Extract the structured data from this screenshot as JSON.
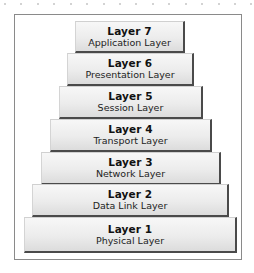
{
  "diagram": {
    "type": "osi-model-stack",
    "layers": [
      {
        "number_label": "Layer 7",
        "name": "Application Layer"
      },
      {
        "number_label": "Layer 6",
        "name": "Presentation Layer"
      },
      {
        "number_label": "Layer 5",
        "name": "Session Layer"
      },
      {
        "number_label": "Layer 4",
        "name": "Transport Layer"
      },
      {
        "number_label": "Layer 3",
        "name": "Network Layer"
      },
      {
        "number_label": "Layer 2",
        "name": "Data Link Layer"
      },
      {
        "number_label": "Layer 1",
        "name": "Physical Layer"
      }
    ]
  },
  "colors": {
    "frame_border": "#8a8a8a",
    "block_shadow": "#4a4a4a",
    "block_fill_top": "#f7f7f7",
    "block_fill_bottom": "#dcdcdc"
  }
}
